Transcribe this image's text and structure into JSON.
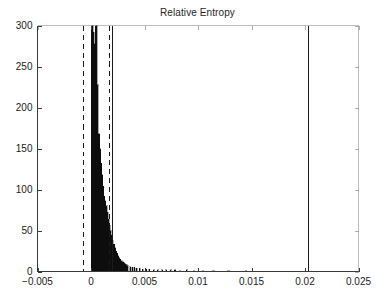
{
  "chart_data": {
    "type": "bar",
    "title": "Relative Entropy",
    "xlabel": "",
    "ylabel": "",
    "xlim": [
      -0.005,
      0.025
    ],
    "ylim": [
      0,
      300
    ],
    "grid": false,
    "legend": null,
    "xticks": [
      -0.005,
      0,
      0.005,
      0.01,
      0.015,
      0.02,
      0.025
    ],
    "xtick_labels": [
      "−0.005",
      "0",
      "0.005",
      "0.01",
      "0.015",
      "0.02",
      "0.025"
    ],
    "yticks": [
      0,
      50,
      100,
      150,
      200,
      250,
      300
    ],
    "ytick_labels": [
      "0",
      "50",
      "100",
      "150",
      "200",
      "250",
      "300"
    ],
    "bin_width": 0.0001,
    "note_clipped": "Tallest bins exceed the y-axis maximum of 300 and are clipped at the top of the axes.",
    "categories": [
      5e-05,
      0.00015,
      0.00025,
      0.00035,
      0.00045,
      0.00055,
      0.00065,
      0.00075,
      0.00085,
      0.00095,
      0.00105,
      0.00115,
      0.00125,
      0.00135,
      0.00145,
      0.00155,
      0.00165,
      0.00175,
      0.00185,
      0.00195,
      0.00205,
      0.00215,
      0.00225,
      0.00235,
      0.00245,
      0.00255,
      0.00265,
      0.00275,
      0.00285,
      0.00295,
      0.00305,
      0.00315,
      0.00325,
      0.00335,
      0.00345,
      0.00365,
      0.00385,
      0.00405,
      0.00425,
      0.00455,
      0.00485,
      0.00515,
      0.00545,
      0.00585,
      0.00625,
      0.00665,
      0.00705,
      0.00745,
      0.00785,
      0.00835,
      0.00895,
      0.00965,
      0.01045,
      0.01145,
      0.01285,
      0.01445
    ],
    "values": [
      300,
      300,
      292,
      278,
      300,
      300,
      228,
      168,
      150,
      132,
      118,
      104,
      92,
      86,
      80,
      72,
      64,
      56,
      50,
      44,
      38,
      33,
      29,
      25,
      22,
      19,
      17,
      15,
      13,
      12,
      11,
      10,
      9,
      8,
      7,
      6,
      5,
      5,
      4,
      4,
      3,
      3,
      3,
      2,
      2,
      2,
      2,
      2,
      2,
      1,
      2,
      1,
      1,
      1,
      1,
      1
    ],
    "vertical_lines": [
      {
        "name": "lower-dashed-marker",
        "x": -0.00072,
        "style": "dashed"
      },
      {
        "name": "upper-dashed-marker",
        "x": 0.00172,
        "style": "dashed"
      },
      {
        "name": "upper-solid-marker",
        "x": 0.00195,
        "style": "solid"
      },
      {
        "name": "outlier-solid-marker",
        "x": 0.02032,
        "style": "solid"
      }
    ]
  },
  "figure": {
    "background_color": "#ffffff",
    "axis_color": "#3a3a3a",
    "bar_color": "#0d0d0d",
    "marker_color": "#1a1a1a"
  }
}
